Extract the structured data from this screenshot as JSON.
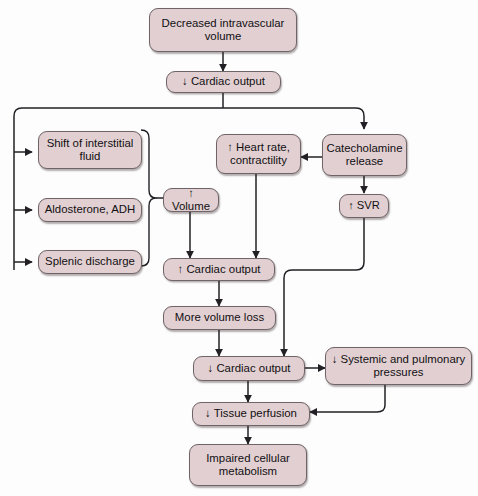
{
  "diagram": {
    "style": {
      "node_fill": "#e2cfd1",
      "node_border": "#6f6467",
      "edge_color": "#222025",
      "background": "#fdfdfd"
    },
    "nodes": [
      {
        "id": "decreased-intravascular-volume",
        "label": "Decreased intravascular\nvolume"
      },
      {
        "id": "decreased-cardiac-output-top",
        "label": "↓ Cardiac output"
      },
      {
        "id": "shift-of-interstitial-fluid",
        "label": "Shift of interstitial\nfluid"
      },
      {
        "id": "aldosterone-adh",
        "label": "Aldosterone, ADH"
      },
      {
        "id": "splenic-discharge",
        "label": "Splenic discharge"
      },
      {
        "id": "increased-volume",
        "label": "↑ Volume"
      },
      {
        "id": "increased-heart-rate-contractility",
        "label": "↑ Heart rate,\ncontractility"
      },
      {
        "id": "catecholamine-release",
        "label": "Catecholamine\nrelease"
      },
      {
        "id": "increased-svr",
        "label": "↑ SVR"
      },
      {
        "id": "increased-cardiac-output",
        "label": "↑ Cardiac output"
      },
      {
        "id": "more-volume-loss",
        "label": "More volume loss"
      },
      {
        "id": "decreased-cardiac-output-bottom",
        "label": "↓ Cardiac output"
      },
      {
        "id": "decreased-systemic-pulmonary-pressures",
        "label": "↓ Systemic and pulmonary\npressures"
      },
      {
        "id": "decreased-tissue-perfusion",
        "label": "↓ Tissue perfusion"
      },
      {
        "id": "impaired-cellular-metabolism",
        "label": "Impaired cellular\nmetabolism"
      }
    ],
    "edges": [
      {
        "from": "decreased-intravascular-volume",
        "to": "decreased-cardiac-output-top"
      },
      {
        "from": "decreased-cardiac-output-top",
        "to": "shift-of-interstitial-fluid"
      },
      {
        "from": "decreased-cardiac-output-top",
        "to": "aldosterone-adh"
      },
      {
        "from": "decreased-cardiac-output-top",
        "to": "splenic-discharge"
      },
      {
        "from": "decreased-cardiac-output-top",
        "to": "catecholamine-release"
      },
      {
        "from": "compensation-brace",
        "to": "increased-volume"
      },
      {
        "from": "catecholamine-release",
        "to": "increased-heart-rate-contractility"
      },
      {
        "from": "catecholamine-release",
        "to": "increased-svr"
      },
      {
        "from": "increased-volume",
        "to": "increased-cardiac-output"
      },
      {
        "from": "increased-heart-rate-contractility",
        "to": "increased-cardiac-output"
      },
      {
        "from": "increased-cardiac-output",
        "to": "more-volume-loss"
      },
      {
        "from": "more-volume-loss",
        "to": "decreased-cardiac-output-bottom"
      },
      {
        "from": "increased-svr",
        "to": "decreased-cardiac-output-bottom"
      },
      {
        "from": "decreased-cardiac-output-bottom",
        "to": "decreased-systemic-pulmonary-pressures"
      },
      {
        "from": "decreased-cardiac-output-bottom",
        "to": "decreased-tissue-perfusion"
      },
      {
        "from": "decreased-systemic-pulmonary-pressures",
        "to": "decreased-tissue-perfusion"
      },
      {
        "from": "decreased-tissue-perfusion",
        "to": "impaired-cellular-metabolism"
      }
    ]
  }
}
